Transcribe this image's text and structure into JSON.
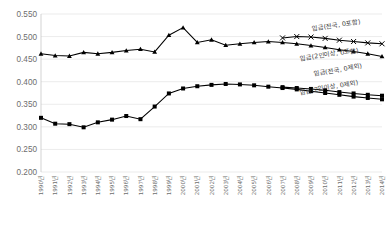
{
  "chart_data": {
    "type": "line",
    "title": "",
    "subtitle": "",
    "xlabel": "",
    "ylabel": "",
    "ylim": [
      0.2,
      0.55
    ],
    "yticks": [
      "0.200",
      "0.250",
      "0.300",
      "0.350",
      "0.400",
      "0.450",
      "0.500",
      "0.550"
    ],
    "ytick_values": [
      0.2,
      0.25,
      0.3,
      0.35,
      0.4,
      0.45,
      0.5,
      0.55
    ],
    "grid": true,
    "legend_position": "inline-annotations",
    "categories": [
      "1990년",
      "1991년",
      "1992년",
      "1993년",
      "1994년",
      "1995년",
      "1996년",
      "1997년",
      "1998년",
      "1999년",
      "2000년",
      "2001년",
      "2002년",
      "2003년",
      "2004년",
      "2005년",
      "2006년",
      "2007년",
      "2008년",
      "2009년",
      "2010년",
      "2011년",
      "2012년",
      "2013년",
      "2014년"
    ],
    "series": [
      {
        "name": "임금(전국, 0포함)",
        "marker": "x",
        "values": [
          null,
          null,
          null,
          null,
          null,
          null,
          null,
          null,
          null,
          null,
          null,
          null,
          null,
          null,
          null,
          null,
          null,
          0.497,
          0.5,
          0.499,
          0.496,
          0.492,
          0.489,
          0.486,
          0.484
        ]
      },
      {
        "name": "임금(2인이상, 0포함)",
        "marker": "triangle",
        "values": [
          0.462,
          0.458,
          0.457,
          0.465,
          0.462,
          0.465,
          0.469,
          0.472,
          0.466,
          0.503,
          0.52,
          0.487,
          0.493,
          0.481,
          0.484,
          0.487,
          0.489,
          0.487,
          0.484,
          0.48,
          0.476,
          0.471,
          0.467,
          0.462,
          0.456
        ]
      },
      {
        "name": "임금(전국, 0제외)",
        "marker": "square",
        "values": [
          null,
          null,
          null,
          null,
          null,
          null,
          null,
          null,
          null,
          null,
          null,
          null,
          null,
          null,
          null,
          null,
          null,
          0.388,
          0.386,
          0.384,
          0.381,
          0.377,
          0.374,
          0.371,
          0.369
        ]
      },
      {
        "name": "임금(2인이상, 0제외)",
        "marker": "square",
        "values": [
          0.32,
          0.307,
          0.306,
          0.299,
          0.31,
          0.316,
          0.324,
          0.317,
          0.345,
          0.374,
          0.385,
          0.39,
          0.393,
          0.395,
          0.394,
          0.392,
          0.389,
          0.386,
          0.383,
          0.379,
          0.375,
          0.371,
          0.367,
          0.364,
          0.361
        ]
      }
    ],
    "annotations": [
      {
        "text": "임금(전국, 0포함)",
        "x": 0.795,
        "y": 0.105,
        "rotate": -8
      },
      {
        "text": "임금(2인이상, 0포함)",
        "x": 0.76,
        "y": 0.295,
        "rotate": -8
      },
      {
        "text": "임금(전국, 0제외)",
        "x": 0.8,
        "y": 0.395,
        "rotate": -10
      },
      {
        "text": "임금(2인이상, 0제외)",
        "x": 0.76,
        "y": 0.51,
        "rotate": -10
      }
    ]
  }
}
